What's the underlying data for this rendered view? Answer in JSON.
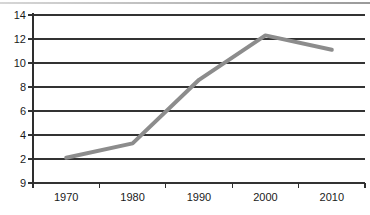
{
  "chart_data": {
    "type": "line",
    "categories": [
      "1970",
      "1980",
      "1990",
      "2000",
      "2010"
    ],
    "series": [
      {
        "name": "series-1",
        "values": [
          2.1,
          3.3,
          8.6,
          12.3,
          11.1
        ]
      }
    ],
    "title": "",
    "xlabel": "",
    "ylabel": "",
    "ylim": [
      0,
      14
    ],
    "ytick_step": 2,
    "ytick_labels_top_to_bottom": [
      "14",
      "12",
      "10",
      "8",
      "6",
      "4",
      "2",
      "9"
    ],
    "xtick_labels": [
      "1970",
      "1980",
      "1990",
      "2000",
      "2010"
    ],
    "grid": "horizontal",
    "legend": "none",
    "colors": {
      "line": "#8c8c8c",
      "grid": "#333333",
      "axis": "#2e2e2e",
      "text": "#1a1a1a",
      "top_rule": "#b3b3b3",
      "background": "#ffffff"
    }
  }
}
